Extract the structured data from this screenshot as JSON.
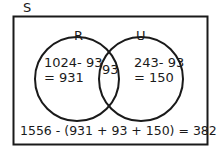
{
  "universe_label": "S",
  "sets": [
    {
      "label": "R",
      "only_expr": "1024- 93",
      "only_result": "= 931"
    },
    {
      "label": "U",
      "only_expr": "243- 93",
      "only_result": "= 150"
    }
  ],
  "intersection": "93",
  "outside_formula": "1556 -  (931 + 93 + 150) = 382",
  "colors": {
    "stroke": "#1a1a1a",
    "background": "#ffffff"
  }
}
